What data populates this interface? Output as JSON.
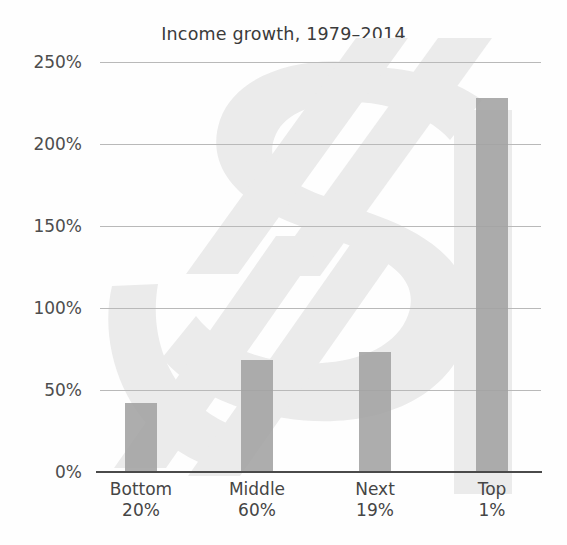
{
  "chart_data": {
    "type": "bar",
    "title": "Income growth, 1979–2014",
    "xlabel": "",
    "ylabel": "",
    "categories": [
      "Bottom 20%",
      "Middle 60%",
      "Next 19%",
      "Top 1%"
    ],
    "category_lines": [
      {
        "line1": "Bottom",
        "line2": "20%"
      },
      {
        "line1": "Middle",
        "line2": "60%"
      },
      {
        "line1": "Next",
        "line2": "19%"
      },
      {
        "line1": "Top",
        "line2": "1%"
      }
    ],
    "values": [
      42,
      68,
      73,
      228
    ],
    "value_unit": "%",
    "ylim": [
      0,
      250
    ],
    "ytick_values": [
      0,
      50,
      100,
      150,
      200,
      250
    ],
    "ytick_labels": [
      "0%",
      "50%",
      "100%",
      "150%",
      "200%",
      "250%"
    ],
    "grid": true,
    "legend": null,
    "bar_color": "#a2a2a2",
    "gridline_color": "#b9b9b9",
    "axis_color": "#4a4a4a",
    "background_watermark": "dollar-sign"
  },
  "decor": {
    "watermark_name": "dollar-sign-watermark",
    "watermark_color": "#ebebeb"
  }
}
